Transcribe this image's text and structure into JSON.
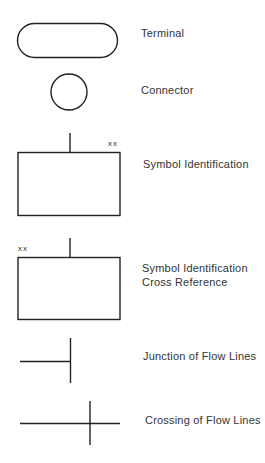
{
  "symbols": [
    {
      "name": "terminal",
      "label": "Terminal"
    },
    {
      "name": "connector",
      "label": "Connector"
    },
    {
      "name": "symbol-identification",
      "label": "Symbol Identification",
      "marker": "xx"
    },
    {
      "name": "symbol-identification-cross-reference",
      "label_line1": "Symbol Identification",
      "label_line2": "Cross Reference",
      "marker": "xx"
    },
    {
      "name": "junction-of-flow-lines",
      "label": "Junction of Flow Lines"
    },
    {
      "name": "crossing-of-flow-lines",
      "label": "Crossing of Flow Lines"
    }
  ],
  "colors": {
    "stroke": "#222222",
    "background": "#ffffff"
  }
}
